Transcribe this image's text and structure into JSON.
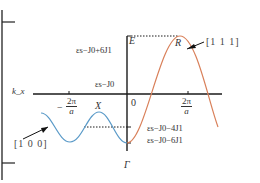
{
  "diagram": {
    "title": "",
    "axes": {
      "x_label": "k_x",
      "y_label": "E",
      "origin_label": "0"
    },
    "x_ticks": [
      {
        "num": "2π",
        "den": "a",
        "sign": "−"
      },
      {
        "num": "2π",
        "den": "a",
        "sign": ""
      }
    ],
    "points": {
      "R": "R",
      "X": "X",
      "Gamma": "Γ"
    },
    "directions": {
      "red": "[1 1 1]",
      "blue": "[1 0 0]"
    },
    "energy_levels": {
      "top": "εs−J0+6J1",
      "mid": "εs−J0",
      "upper_low": "εs−J0−4J1",
      "low": "εs−J0−6J1"
    },
    "colors": {
      "red_curve": "#d9805a",
      "blue_curve": "#5a9ac8",
      "axis": "#1a1a1a",
      "text": "#333333"
    }
  }
}
